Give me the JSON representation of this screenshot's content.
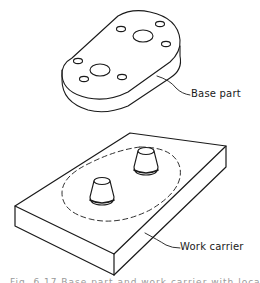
{
  "figure": {
    "labels": {
      "base_part": "Base part",
      "work_carrier": "Work carrier"
    },
    "caption": "Fig. 6.17  Base part and work carrier with locating pins",
    "colors": {
      "line": "#1a1a1a",
      "background": "#ffffff"
    }
  }
}
